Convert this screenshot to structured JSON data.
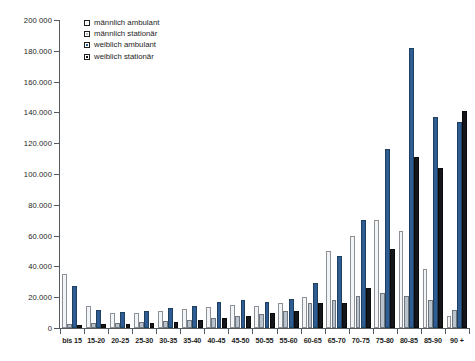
{
  "chart_data": {
    "type": "bar",
    "title": "",
    "xlabel": "",
    "ylabel": "",
    "ylim": [
      0,
      200000
    ],
    "grid": false,
    "legend_position": "top-left",
    "ytick_labels": [
      "200 000",
      "180.000",
      "160.000",
      "140.000",
      "120.000",
      "100.000",
      "80.000",
      "60.000",
      "40.000",
      "20.000",
      "0"
    ],
    "ytick_values": [
      200000,
      180000,
      160000,
      140000,
      120000,
      100000,
      80000,
      60000,
      40000,
      20000,
      0
    ],
    "categories": [
      "bis 15",
      "15-20",
      "20-25",
      "25-30",
      "30-35",
      "35-40",
      "40-45",
      "45-50",
      "50-55",
      "55-60",
      "60-65",
      "65-70",
      "70-75",
      "75-80",
      "80-85",
      "85-90",
      "90 +"
    ],
    "series": [
      {
        "name": "männlich ambulant",
        "color": "#f2f4f5",
        "values": [
          35000,
          14000,
          9500,
          10000,
          11000,
          12500,
          13500,
          15000,
          14500,
          16000,
          20000,
          50000,
          60000,
          70000,
          63000,
          38000,
          8000
        ]
      },
      {
        "name": "männlich stationär",
        "color": "#b9c3ce",
        "values": [
          2500,
          3000,
          3000,
          4000,
          4500,
          5500,
          6500,
          8000,
          9000,
          11000,
          16000,
          18000,
          21000,
          23000,
          21000,
          18000,
          12000
        ]
      },
      {
        "name": "weiblich ambulant",
        "color": "#2f5d93",
        "values": [
          27000,
          12000,
          10500,
          11000,
          13000,
          14500,
          17000,
          18000,
          17000,
          19000,
          29000,
          47000,
          70000,
          116000,
          182000,
          137000,
          134000
        ]
      },
      {
        "name": "weiblich stationär",
        "color": "#15161a",
        "values": [
          2000,
          2500,
          2500,
          3500,
          4000,
          5000,
          6500,
          8000,
          9500,
          11000,
          16000,
          16000,
          26000,
          51000,
          111000,
          104000,
          141000
        ]
      }
    ]
  },
  "axis": {
    "y_max_label": "200 000",
    "y_zero_label": "0"
  }
}
